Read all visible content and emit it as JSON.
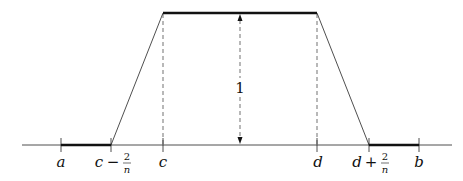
{
  "diagram": {
    "type": "trapezoidal function plot",
    "colors": {
      "line": "#111111",
      "background": "#ffffff"
    },
    "axis": {
      "y": 145,
      "x_start": 22,
      "x_end": 452
    },
    "ticks": [
      {
        "id": "a",
        "x": 61,
        "label": "a"
      },
      {
        "id": "c-minus",
        "x": 111,
        "label_main": "c",
        "label_op": "−",
        "frac_num": "2",
        "frac_den": "n"
      },
      {
        "id": "c",
        "x": 163,
        "label": "c"
      },
      {
        "id": "d",
        "x": 317,
        "label": "d"
      },
      {
        "id": "d-plus",
        "x": 369,
        "label_main": "d",
        "label_op": "+",
        "frac_num": "2",
        "frac_den": "n"
      },
      {
        "id": "b",
        "x": 419,
        "label": "b"
      }
    ],
    "plateau": {
      "y": 13,
      "x_start": 163,
      "x_end": 317
    },
    "height_marker": {
      "x": 240,
      "label": "1"
    }
  }
}
